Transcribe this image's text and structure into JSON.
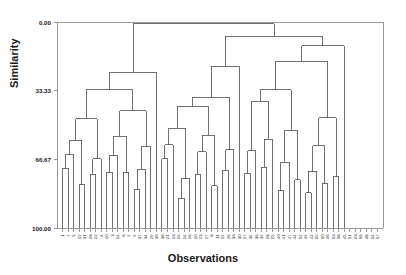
{
  "chart_data": {
    "type": "line",
    "subtype": "dendrogram",
    "title": "",
    "xlabel": "Observations",
    "ylabel": "Similarity",
    "ylim": [
      0.0,
      100.0
    ],
    "y_axis_inverted": true,
    "ytick_labels": [
      "0.00",
      "33.33",
      "66.67",
      "100.00"
    ],
    "ytick_values": [
      0.0,
      33.33,
      66.67,
      100.0
    ],
    "grid": false,
    "legend": null,
    "frame": true,
    "n_leaves": 58,
    "leaf_labels": [
      "1",
      "7",
      "5",
      "12",
      "31",
      "28",
      "22",
      "4",
      "20",
      "3",
      "14",
      "6",
      "2",
      "9",
      "37",
      "34",
      "29",
      "35",
      "38",
      "21",
      "13",
      "15",
      "24",
      "16",
      "10",
      "23",
      "27",
      "8",
      "11",
      "19",
      "26",
      "33",
      "30",
      "17",
      "39",
      "36",
      "32",
      "18",
      "25",
      "40",
      "41",
      "47",
      "44",
      "52",
      "49",
      "42",
      "55",
      "50",
      "46",
      "53",
      "58",
      "45",
      "51",
      "43",
      "56",
      "48",
      "54",
      "57"
    ],
    "leaf_similarity": 100.0,
    "merges": [
      {
        "id": "m1",
        "left": {
          "leaf": 0
        },
        "right": {
          "leaf": 1
        },
        "similarity": 71.0
      },
      {
        "id": "m2",
        "left": {
          "node": "m1"
        },
        "right": {
          "leaf": 2
        },
        "similarity": 64.5
      },
      {
        "id": "m3",
        "left": {
          "leaf": 3
        },
        "right": {
          "leaf": 4
        },
        "similarity": 79.0
      },
      {
        "id": "m4",
        "left": {
          "node": "m2"
        },
        "right": {
          "node": "m3"
        },
        "similarity": 57.5
      },
      {
        "id": "m5",
        "left": {
          "leaf": 5
        },
        "right": {
          "leaf": 6
        },
        "similarity": 74.0
      },
      {
        "id": "m6",
        "left": {
          "node": "m5"
        },
        "right": {
          "leaf": 7
        },
        "similarity": 66.5
      },
      {
        "id": "m7",
        "left": {
          "node": "m4"
        },
        "right": {
          "node": "m6"
        },
        "similarity": 47.0
      },
      {
        "id": "m8",
        "left": {
          "leaf": 8
        },
        "right": {
          "leaf": 9
        },
        "similarity": 73.0
      },
      {
        "id": "m9",
        "left": {
          "node": "m8"
        },
        "right": {
          "leaf": 10
        },
        "similarity": 65.0
      },
      {
        "id": "m10",
        "left": {
          "leaf": 11
        },
        "right": {
          "leaf": 12
        },
        "similarity": 73.0
      },
      {
        "id": "m11",
        "left": {
          "node": "m9"
        },
        "right": {
          "node": "m10"
        },
        "similarity": 55.5
      },
      {
        "id": "m12",
        "left": {
          "leaf": 13
        },
        "right": {
          "leaf": 14
        },
        "similarity": 81.5
      },
      {
        "id": "m13",
        "left": {
          "node": "m12"
        },
        "right": {
          "leaf": 15
        },
        "similarity": 71.5
      },
      {
        "id": "m14",
        "left": {
          "node": "m13"
        },
        "right": {
          "leaf": 16
        },
        "similarity": 60.5
      },
      {
        "id": "m15",
        "left": {
          "node": "m11"
        },
        "right": {
          "node": "m14"
        },
        "similarity": 43.0
      },
      {
        "id": "m16",
        "left": {
          "node": "m7"
        },
        "right": {
          "node": "m15"
        },
        "similarity": 33.0
      },
      {
        "id": "m17",
        "left": {
          "node": "m16"
        },
        "right": {
          "leaf": 17
        },
        "similarity": 24.5
      },
      {
        "id": "m18",
        "left": {
          "leaf": 18
        },
        "right": {
          "leaf": 19
        },
        "similarity": 66.5
      },
      {
        "id": "m19",
        "left": {
          "node": "m18"
        },
        "right": {
          "leaf": 20
        },
        "similarity": 59.5
      },
      {
        "id": "m20",
        "left": {
          "leaf": 21
        },
        "right": {
          "leaf": 22
        },
        "similarity": 85.5
      },
      {
        "id": "m21",
        "left": {
          "node": "m20"
        },
        "right": {
          "leaf": 23
        },
        "similarity": 76.0
      },
      {
        "id": "m22",
        "left": {
          "node": "m19"
        },
        "right": {
          "node": "m21"
        },
        "similarity": 51.5
      },
      {
        "id": "m23",
        "left": {
          "leaf": 24
        },
        "right": {
          "leaf": 25
        },
        "similarity": 74.0
      },
      {
        "id": "m24",
        "left": {
          "node": "m23"
        },
        "right": {
          "leaf": 26
        },
        "similarity": 63.0
      },
      {
        "id": "m25",
        "left": {
          "leaf": 27
        },
        "right": {
          "leaf": 28
        },
        "similarity": 79.5
      },
      {
        "id": "m26",
        "left": {
          "node": "m24"
        },
        "right": {
          "node": "m25"
        },
        "similarity": 55.0
      },
      {
        "id": "m27",
        "left": {
          "node": "m22"
        },
        "right": {
          "node": "m26"
        },
        "similarity": 41.0
      },
      {
        "id": "m28",
        "left": {
          "leaf": 29
        },
        "right": {
          "leaf": 30
        },
        "similarity": 72.0
      },
      {
        "id": "m29",
        "left": {
          "node": "m28"
        },
        "right": {
          "leaf": 31
        },
        "similarity": 62.0
      },
      {
        "id": "m30",
        "left": {
          "node": "m27"
        },
        "right": {
          "node": "m29"
        },
        "similarity": 36.5
      },
      {
        "id": "m31",
        "left": {
          "node": "m30"
        },
        "right": {
          "leaf": 32
        },
        "similarity": 21.5
      },
      {
        "id": "m32",
        "left": {
          "leaf": 33
        },
        "right": {
          "leaf": 34
        },
        "similarity": 73.5
      },
      {
        "id": "m33",
        "left": {
          "node": "m32"
        },
        "right": {
          "leaf": 35
        },
        "similarity": 62.5
      },
      {
        "id": "m34",
        "left": {
          "leaf": 36
        },
        "right": {
          "leaf": 37
        },
        "similarity": 70.5
      },
      {
        "id": "m35",
        "left": {
          "node": "m34"
        },
        "right": {
          "leaf": 38
        },
        "similarity": 57.0
      },
      {
        "id": "m36",
        "left": {
          "node": "m33"
        },
        "right": {
          "node": "m35"
        },
        "similarity": 38.5
      },
      {
        "id": "m37",
        "left": {
          "leaf": 39
        },
        "right": {
          "leaf": 40
        },
        "similarity": 82.0
      },
      {
        "id": "m38",
        "left": {
          "node": "m37"
        },
        "right": {
          "leaf": 41
        },
        "similarity": 68.0
      },
      {
        "id": "m39",
        "left": {
          "leaf": 42
        },
        "right": {
          "leaf": 43
        },
        "similarity": 76.5
      },
      {
        "id": "m40",
        "left": {
          "node": "m38"
        },
        "right": {
          "node": "m39"
        },
        "similarity": 52.5
      },
      {
        "id": "m41",
        "left": {
          "node": "m36"
        },
        "right": {
          "node": "m40"
        },
        "similarity": 33.0
      },
      {
        "id": "m42",
        "left": {
          "leaf": 44
        },
        "right": {
          "leaf": 45
        },
        "similarity": 83.0
      },
      {
        "id": "m43",
        "left": {
          "node": "m42"
        },
        "right": {
          "leaf": 46
        },
        "similarity": 72.5
      },
      {
        "id": "m44",
        "left": {
          "leaf": 47
        },
        "right": {
          "leaf": 48
        },
        "similarity": 78.5
      },
      {
        "id": "m45",
        "left": {
          "node": "m43"
        },
        "right": {
          "node": "m44"
        },
        "similarity": 60.0
      },
      {
        "id": "m46",
        "left": {
          "leaf": 49
        },
        "right": {
          "leaf": 50
        },
        "similarity": 75.0
      },
      {
        "id": "m47",
        "left": {
          "node": "m45"
        },
        "right": {
          "node": "m46"
        },
        "similarity": 46.5
      },
      {
        "id": "m48",
        "left": {
          "node": "m41"
        },
        "right": {
          "node": "m47"
        },
        "similarity": 19.0
      },
      {
        "id": "m49",
        "left": {
          "node": "m48"
        },
        "right": {
          "leaf": 51
        },
        "similarity": 11.5
      },
      {
        "id": "m50",
        "left": {
          "node": "m31"
        },
        "right": {
          "node": "m49"
        },
        "similarity": 7.0
      },
      {
        "id": "m51",
        "left": {
          "node": "m17"
        },
        "right": {
          "node": "m50"
        },
        "similarity": 0.8
      }
    ],
    "colors": {
      "line": "#4d4d4d",
      "frame": "#999999",
      "text": "#1a1a1a",
      "background": "#ffffff"
    }
  },
  "figure": {
    "plot_area": {
      "left": 57,
      "top": 22,
      "right": 383,
      "bottom": 228
    }
  }
}
